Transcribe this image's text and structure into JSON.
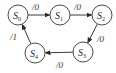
{
  "diagram": {
    "type": "state-transition",
    "colors": {
      "stroke": "#4a4a4a",
      "text": "#2a2a2a",
      "background": "#ffffff"
    },
    "states": [
      {
        "id": "S0",
        "base": "S",
        "sub": "0",
        "cx": 18,
        "cy": 15
      },
      {
        "id": "S1",
        "base": "S",
        "sub": "1",
        "cx": 60,
        "cy": 15
      },
      {
        "id": "S2",
        "base": "S",
        "sub": "2",
        "cx": 102,
        "cy": 15
      },
      {
        "id": "S3",
        "base": "S",
        "sub": "3",
        "cx": 83,
        "cy": 52
      },
      {
        "id": "S4",
        "base": "S",
        "sub": "4",
        "cx": 35,
        "cy": 53
      }
    ],
    "radius": 10,
    "transitions": [
      {
        "from": "S0",
        "to": "S1",
        "label": "/0",
        "lx": 32,
        "ly": 10
      },
      {
        "from": "S1",
        "to": "S2",
        "label": "/0",
        "lx": 74,
        "ly": 10
      },
      {
        "from": "S2",
        "to": "S3",
        "label": "/0",
        "lx": 97,
        "ly": 42
      },
      {
        "from": "S3",
        "to": "S4",
        "label": "/0",
        "lx": 56,
        "ly": 68
      },
      {
        "from": "S4",
        "to": "S0",
        "label": "/1",
        "lx": 10,
        "ly": 40
      }
    ]
  }
}
